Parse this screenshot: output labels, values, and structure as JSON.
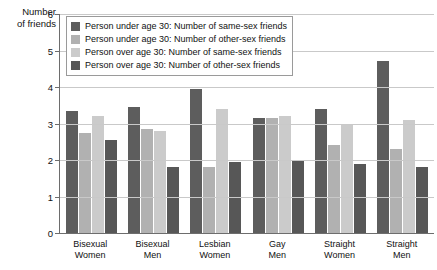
{
  "chart_data": {
    "type": "bar",
    "title": "",
    "xlabel": "",
    "ylabel": "Number\nof friends",
    "ylim": [
      0,
      6
    ],
    "yticks": [
      0,
      1,
      2,
      3,
      4,
      5,
      6
    ],
    "ytick_labels": [
      "0",
      "1",
      "2",
      "3",
      "4",
      "5",
      "6"
    ],
    "grid": true,
    "legend_position": "top-left-inside",
    "categories": [
      "Bisexual\nWomen",
      "Bisexual\nMen",
      "Lesbian\nWomen",
      "Gay\nMen",
      "Straight\nWomen",
      "Straight\nMen"
    ],
    "series": [
      {
        "name": "Person under age 30: Number of same-sex friends",
        "color": "#5d5d5d",
        "values": [
          3.35,
          3.45,
          3.95,
          3.15,
          3.4,
          4.7
        ]
      },
      {
        "name": "Person under age 30: Number of other-sex friends",
        "color": "#b1b1b1",
        "values": [
          2.75,
          2.85,
          1.8,
          3.15,
          2.4,
          2.3
        ]
      },
      {
        "name": "Person over age 30: Number of same-sex friends",
        "color": "#cbcbcb",
        "values": [
          3.2,
          2.8,
          3.4,
          3.2,
          3.0,
          3.1
        ]
      },
      {
        "name": "Person over age 30: Number of other-sex friends",
        "color": "#575757",
        "values": [
          2.55,
          1.8,
          1.95,
          2.0,
          1.9,
          1.8
        ]
      }
    ]
  },
  "legend": {
    "items": [
      {
        "label": "Person under age 30: Number of same-sex friends",
        "color": "#5d5d5d"
      },
      {
        "label": "Person under age 30: Number of other-sex friends",
        "color": "#b1b1b1"
      },
      {
        "label": "Person over age 30: Number of same-sex friends",
        "color": "#cbcbcb"
      },
      {
        "label": "Person over age 30: Number of other-sex friends",
        "color": "#575757"
      }
    ]
  },
  "axis": {
    "y_title": "Number\nof friends"
  }
}
